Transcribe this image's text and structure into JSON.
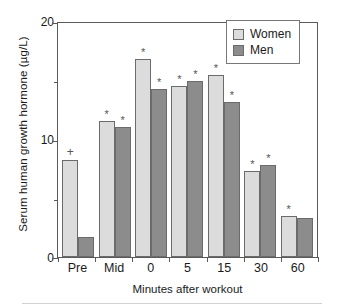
{
  "chart_data": {
    "type": "bar",
    "title": "",
    "xlabel": "Minutes after workout",
    "ylabel": "Serum human growth hormone (µg/L)",
    "categories": [
      "Pre",
      "Mid",
      "0",
      "5",
      "15",
      "30",
      "60"
    ],
    "series": [
      {
        "name": "Women",
        "color": "#dcdcdc",
        "values": [
          8.2,
          11.5,
          16.8,
          14.5,
          15.4,
          7.3,
          3.5
        ],
        "markers": [
          "+",
          "*",
          "*",
          "*",
          "*",
          "*",
          "*"
        ]
      },
      {
        "name": "Men",
        "color": "#8c8c8c",
        "values": [
          1.7,
          11.0,
          14.2,
          14.9,
          13.1,
          7.8,
          3.3
        ],
        "markers": [
          "",
          "*",
          "*",
          "*",
          "*",
          "*",
          ""
        ]
      }
    ],
    "ylim": [
      0,
      20
    ],
    "ytick_labels": [
      "0",
      "10",
      "20"
    ],
    "ytick_values": [
      0,
      10,
      20
    ],
    "yminor_tick_values": [
      5,
      15
    ],
    "grid": false,
    "legend_position": "top-right",
    "legend_entries": [
      "Women",
      "Men"
    ]
  },
  "legend": {
    "women_label": "Women",
    "men_label": "Men"
  },
  "axes": {
    "y_title": "Serum human growth hormone (µg/L)",
    "x_title": "Minutes after workout",
    "y_labels": [
      "20",
      "10",
      "0"
    ],
    "x_labels": [
      "Pre",
      "Mid",
      "0",
      "5",
      "15",
      "30",
      "60"
    ]
  }
}
